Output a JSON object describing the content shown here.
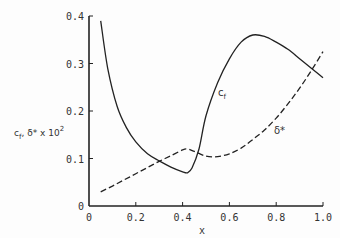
{
  "chart_data": {
    "type": "line",
    "title": "",
    "xlabel": "x",
    "ylabel": "c_f, δ* x 10^2",
    "ylabel_parts": {
      "main": "c",
      "sub": "f",
      "rest": ", δ* x 10",
      "sup": "2"
    },
    "xlim": [
      0,
      1.0
    ],
    "ylim": [
      0,
      0.4
    ],
    "grid": false,
    "legend": "inline labels",
    "x_ticks": [
      "0",
      "0.2",
      "0.4",
      "0.6",
      "0.8",
      "1.0"
    ],
    "y_ticks": [
      "0",
      "0.1",
      "0.2",
      "0.3",
      "0.4"
    ],
    "series": [
      {
        "name": "c_f",
        "label_main": "c",
        "label_sub": "f",
        "style": "solid",
        "x": [
          0.05,
          0.08,
          0.12,
          0.16,
          0.2,
          0.25,
          0.3,
          0.35,
          0.4,
          0.42,
          0.44,
          0.47,
          0.5,
          0.55,
          0.6,
          0.65,
          0.7,
          0.75,
          0.8,
          0.85,
          0.9,
          0.95,
          1.0
        ],
        "y": [
          0.39,
          0.29,
          0.21,
          0.165,
          0.135,
          0.11,
          0.095,
          0.082,
          0.072,
          0.07,
          0.08,
          0.12,
          0.19,
          0.26,
          0.31,
          0.345,
          0.36,
          0.357,
          0.345,
          0.33,
          0.31,
          0.29,
          0.27
        ]
      },
      {
        "name": "δ*",
        "label": "δ*",
        "style": "dashed",
        "x": [
          0.05,
          0.1,
          0.15,
          0.2,
          0.25,
          0.3,
          0.35,
          0.4,
          0.42,
          0.45,
          0.5,
          0.55,
          0.6,
          0.65,
          0.7,
          0.75,
          0.8,
          0.85,
          0.9,
          0.95,
          1.0
        ],
        "y": [
          0.03,
          0.042,
          0.055,
          0.068,
          0.081,
          0.094,
          0.106,
          0.118,
          0.12,
          0.115,
          0.105,
          0.104,
          0.11,
          0.122,
          0.14,
          0.16,
          0.185,
          0.215,
          0.248,
          0.285,
          0.325
        ]
      }
    ]
  }
}
